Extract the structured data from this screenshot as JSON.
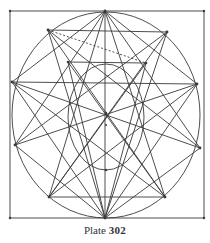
{
  "caption": {
    "label": "Plate",
    "number": "302"
  },
  "colors": {
    "ink": "#3a3a3a",
    "paper": "#ffffff"
  },
  "diagram": {
    "square": {
      "x1": 10,
      "y1": 11,
      "x2": 204,
      "y2": 218
    },
    "outer_circle": {
      "cx": 106,
      "cy": 115,
      "rx": 94,
      "ry": 103
    },
    "inner_circle": {
      "cx": 106,
      "cy": 117,
      "rx": 48,
      "ry": 52
    },
    "points": {
      "A": [
        105,
        11
      ],
      "top_right_corner": [
        204,
        11
      ],
      "M": [
        48,
        30
      ],
      "C": [
        167,
        32
      ],
      "K": [
        12,
        82
      ],
      "V": [
        197,
        84
      ],
      "L": [
        15,
        145
      ],
      "R": [
        200,
        148
      ],
      "T": [
        49,
        197
      ],
      "S": [
        165,
        197
      ],
      "B": [
        10,
        218
      ],
      "F": [
        105,
        218
      ],
      "E": [
        204,
        218
      ],
      "inner_left": [
        68,
        62
      ],
      "inner_right": [
        146,
        63
      ],
      "center_upper": [
        106,
        113
      ],
      "center": [
        106,
        125
      ],
      "inner_bottom": [
        106,
        170
      ],
      "inner_left_mid": [
        73,
        124
      ],
      "inner_right_mid": [
        139,
        124
      ]
    }
  }
}
